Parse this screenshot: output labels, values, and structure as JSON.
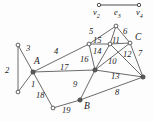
{
  "figure": {
    "name": "graph-diagram",
    "background": "#fdfdfd",
    "stroke": "#3a3a3a",
    "text_color": "#1a1a1a"
  },
  "top_fragment": {
    "name": "edge-fragment-top",
    "left_vertex_label": "v",
    "left_vertex_sub": "2",
    "edge_label": "e",
    "edge_sub": "3",
    "right_vertex_label": "v",
    "right_vertex_sub": "4"
  },
  "main_graph": {
    "vertex_labels": [
      {
        "id": "A",
        "text": "A",
        "x": 34,
        "y": 62
      },
      {
        "id": "B",
        "text": "B",
        "x": 84,
        "y": 107
      },
      {
        "id": "C",
        "text": "C",
        "x": 135,
        "y": 38
      }
    ],
    "edge_labels": [
      {
        "id": "e1",
        "text": "1",
        "x": 31,
        "y": 84
      },
      {
        "id": "e2",
        "text": "2",
        "x": 6,
        "y": 70
      },
      {
        "id": "e3",
        "text": "3",
        "x": 26,
        "y": 48
      },
      {
        "id": "e4",
        "text": "4",
        "x": 54,
        "y": 51
      },
      {
        "id": "e5",
        "text": "5",
        "x": 91,
        "y": 31
      },
      {
        "id": "e6",
        "text": "6",
        "x": 124,
        "y": 31
      },
      {
        "id": "e7",
        "text": "7",
        "x": 139,
        "y": 53
      },
      {
        "id": "e8",
        "text": "8",
        "x": 117,
        "y": 92
      },
      {
        "id": "e9",
        "text": "9",
        "x": 74,
        "y": 84
      },
      {
        "id": "e10",
        "text": "10",
        "x": 111,
        "y": 61
      },
      {
        "id": "e11",
        "text": "11",
        "x": 116,
        "y": 42
      },
      {
        "id": "e12",
        "text": "12",
        "x": 126,
        "y": 55
      },
      {
        "id": "e13",
        "text": "13",
        "x": 114,
        "y": 76
      },
      {
        "id": "e14",
        "text": "14",
        "x": 96,
        "y": 52
      },
      {
        "id": "e15",
        "text": "15",
        "x": 97,
        "y": 42
      },
      {
        "id": "e16",
        "text": "16",
        "x": 83,
        "y": 59
      },
      {
        "id": "e17",
        "text": "17",
        "x": 62,
        "y": 67
      },
      {
        "id": "e18",
        "text": "18",
        "x": 38,
        "y": 95
      },
      {
        "id": "e19",
        "text": "19",
        "x": 64,
        "y": 110
      }
    ],
    "nodes": [
      {
        "id": "n_topleft",
        "x": 18,
        "y": 45,
        "filled": false
      },
      {
        "id": "n_A",
        "x": 33,
        "y": 72,
        "filled": true
      },
      {
        "id": "n_botleft",
        "x": 18,
        "y": 92,
        "filled": false
      },
      {
        "id": "n_lowmid",
        "x": 53,
        "y": 108,
        "filled": false
      },
      {
        "id": "n_B",
        "x": 80,
        "y": 100,
        "filled": true
      },
      {
        "id": "n_hub",
        "x": 95,
        "y": 70,
        "filled": true
      },
      {
        "id": "n_m1",
        "x": 89,
        "y": 44,
        "filled": false
      },
      {
        "id": "n_m2",
        "x": 110,
        "y": 44,
        "filled": false
      },
      {
        "id": "n_C",
        "x": 130,
        "y": 43,
        "filled": false
      },
      {
        "id": "n_apex",
        "x": 116,
        "y": 26,
        "filled": false
      },
      {
        "id": "n_right",
        "x": 143,
        "y": 77,
        "filled": false
      }
    ],
    "edges": [
      {
        "id": "E2",
        "from": "n_topleft",
        "to": "n_botleft",
        "label": "2"
      },
      {
        "id": "E3",
        "from": "n_topleft",
        "to": "n_A",
        "label": "3"
      },
      {
        "id": "E1",
        "from": "n_A",
        "to": "n_botleft",
        "label": "1"
      },
      {
        "id": "E18",
        "from": "n_A",
        "to": "n_lowmid",
        "label": "18"
      },
      {
        "id": "E19",
        "from": "n_lowmid",
        "to": "n_B",
        "label": "19"
      },
      {
        "id": "E4",
        "from": "n_A",
        "to": "n_m1",
        "label": "4"
      },
      {
        "id": "E17",
        "from": "n_A",
        "to": "n_hub",
        "label": "17"
      },
      {
        "id": "E9",
        "from": "n_hub",
        "to": "n_B",
        "label": "9"
      },
      {
        "id": "E8",
        "from": "n_B",
        "to": "n_right",
        "label": "8"
      },
      {
        "id": "E13",
        "from": "n_hub",
        "to": "n_right",
        "label": "13"
      },
      {
        "id": "E16",
        "from": "n_m1",
        "to": "n_hub",
        "label": "16"
      },
      {
        "id": "E15",
        "from": "n_m1",
        "to": "n_m2",
        "label": "15"
      },
      {
        "id": "E11",
        "from": "n_m2",
        "to": "n_C",
        "label": "11"
      },
      {
        "id": "E5",
        "from": "n_m1",
        "to": "n_apex",
        "label": "5"
      },
      {
        "id": "E6",
        "from": "n_apex",
        "to": "n_C",
        "label": "6"
      },
      {
        "id": "E14",
        "from": "n_m2",
        "to": "n_hub",
        "label": "14"
      },
      {
        "id": "E10",
        "from": "n_C",
        "to": "n_hub",
        "label": "10"
      },
      {
        "id": "E12",
        "from": "n_m2",
        "to": "n_right",
        "label": "12"
      },
      {
        "id": "E7",
        "from": "n_C",
        "to": "n_right",
        "label": "7"
      },
      {
        "id": "Eapex",
        "from": "n_apex",
        "to": "n_m2",
        "label": ""
      }
    ]
  }
}
